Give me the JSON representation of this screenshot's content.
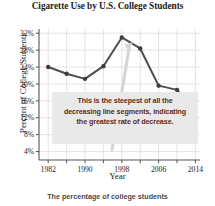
{
  "chart_data": {
    "type": "line",
    "title": "Cigarette Use by U.S. College Students",
    "xlabel": "Year",
    "ylabel": "Percent of College Students",
    "x": [
      1982,
      1986,
      1990,
      1994,
      1998,
      2002,
      2006,
      2010,
      2014
    ],
    "values": [
      24.0,
      22.4,
      21.2,
      24.2,
      31.0,
      28.4,
      19.6,
      18.6,
      13.6
    ],
    "xlim": [
      1980,
      2015
    ],
    "ylim": [
      2,
      33
    ],
    "xticks": [
      1982,
      1986,
      1990,
      1994,
      1998,
      2002,
      2006,
      2010,
      2014
    ],
    "xticklabels": [
      "1982",
      "",
      "1990",
      "",
      "1998",
      "",
      "2006",
      "",
      "2014"
    ],
    "yticks": [
      4,
      8,
      12,
      16,
      20,
      24,
      28,
      32
    ],
    "yticklabels": [
      "4%",
      "8%",
      "12%",
      "16%",
      "20%",
      "24%",
      "28%",
      "32%"
    ],
    "grid": true,
    "legend": "none",
    "line_color": "#4d4d4d",
    "marker_color": "#3d3d3d",
    "grid_color": "#d8d8d8",
    "annotations": [
      {
        "name": "steepest-segment-callout",
        "lines": [
          "This is the steepest of all the",
          "decreasing line segments, indicating",
          "the greatest rate of decrease."
        ],
        "text_color": "#5d2b22",
        "background_color": "#e9e9e9",
        "points_to_segment": [
          1998,
          2002
        ]
      }
    ]
  },
  "caption": {
    "text": "The percentage of college students"
  }
}
